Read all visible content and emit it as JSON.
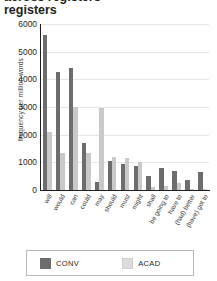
{
  "title": {
    "clipped_line": "across registers",
    "line": "registers"
  },
  "legend": {
    "items": [
      {
        "key": "CONV",
        "label": "CONV",
        "color": "#6d6d6d"
      },
      {
        "key": "ACAD",
        "label": "ACAD",
        "color": "#dcdcdc"
      }
    ]
  },
  "chart_data": {
    "type": "bar",
    "title": "registers",
    "xlabel": "",
    "ylabel": "frequency per million words",
    "ylim": [
      0,
      6000
    ],
    "yticks": [
      6000,
      5000,
      4000,
      3000,
      2000,
      1000,
      0
    ],
    "ytick_labels": [
      "6000",
      "5000",
      "4000",
      "3000",
      "2000",
      "1000",
      "0"
    ],
    "grid": true,
    "legend_position": "bottom",
    "categories": [
      "will",
      "would",
      "can",
      "could",
      "may",
      "should",
      "must",
      "might",
      "shall",
      "be going to",
      "have to",
      "(had) better",
      "(have) got to"
    ],
    "series": [
      {
        "name": "CONV",
        "color": "#6d6d6d",
        "values": [
          5600,
          4250,
          4400,
          1700,
          300,
          1050,
          950,
          850,
          500,
          800,
          700,
          350,
          650
        ]
      },
      {
        "name": "ACAD",
        "color": "#c9c9c9",
        "values": [
          2100,
          1350,
          3000,
          1350,
          2950,
          1200,
          1150,
          1000,
          120,
          150,
          250,
          50,
          30
        ]
      }
    ]
  }
}
